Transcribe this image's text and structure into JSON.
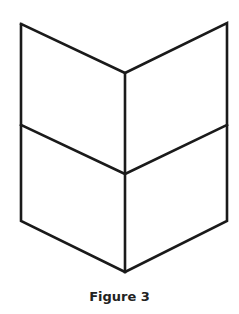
{
  "figure": {
    "caption": "Figure 3",
    "stroke_color": "#1a1a1a",
    "background": "#ffffff",
    "shape": "folded-hexagonal-prism (two stacked chevron panels)",
    "vertices": {
      "top_left": [
        21,
        24
      ],
      "top_right": [
        227,
        23
      ],
      "top_center": [
        125,
        73
      ],
      "mid_left": [
        21,
        125
      ],
      "mid_right": [
        227,
        125
      ],
      "mid_center": [
        125,
        174
      ],
      "bottom_left": [
        21,
        221
      ],
      "bottom_right": [
        227,
        221
      ],
      "bottom_center": [
        125,
        272
      ]
    }
  }
}
